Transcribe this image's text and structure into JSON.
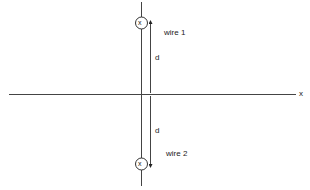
{
  "diagram": {
    "axis_label": "x",
    "wires": [
      {
        "label": "wire 1",
        "symbol": "x",
        "direction": "into page"
      },
      {
        "label": "wire 2",
        "symbol": "x",
        "direction": "into page"
      }
    ],
    "distance_labels": [
      "d",
      "d"
    ],
    "colors": {
      "line": "#333333",
      "background": "#ffffff"
    }
  }
}
